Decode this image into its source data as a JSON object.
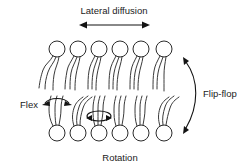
{
  "figure": {
    "title_top": "Lateral diffusion",
    "label_bottom": "Rotation",
    "label_left": "Flex",
    "label_right": "Flip-flop",
    "background_color": "#ffffff",
    "stroke_color": "#2b2b2b",
    "text_color": "#1b1b1b"
  },
  "membrane": {
    "leaflets": [
      {
        "name": "upper-leaflet",
        "orientation": "heads-up",
        "lipid_count": 6,
        "head_radius": 8,
        "head_center_y": 49,
        "tail_length": 40,
        "first_head_center_x": 57,
        "spacing_x": 21
      },
      {
        "name": "lower-leaflet",
        "orientation": "heads-down",
        "lipid_count": 6,
        "head_radius": 8,
        "head_center_y": 133,
        "tail_length": 40,
        "first_head_center_x": 57,
        "spacing_x": 21
      }
    ],
    "total_lipids": 12
  },
  "annotations": [
    {
      "name": "lateral-diffusion",
      "label": "Lateral diffusion",
      "arrow_type": "double-headed-straight",
      "orientation": "horizontal",
      "text_x": 126,
      "text_y": 12,
      "arrow_x1": 81,
      "arrow_x2": 148,
      "arrow_y": 25
    },
    {
      "name": "flex",
      "label": "Flex",
      "arrow_type": "double-headed-curved",
      "orientation": "horizontal-arc",
      "text_x": 29,
      "text_y": 108,
      "pointer_from_x": 42,
      "pointer_to_x": 50
    },
    {
      "name": "rotation",
      "label": "Rotation",
      "arrow_type": "ellipse-double-headed",
      "orientation": "axial",
      "text_x": 120,
      "text_y": 159,
      "ellipse_cx": 100,
      "ellipse_cy": 117,
      "ellipse_rx": 12,
      "ellipse_ry": 5
    },
    {
      "name": "flip-flop",
      "label": "Flip-flop",
      "arrow_type": "double-headed-curved",
      "orientation": "vertical-arc",
      "text_x": 224,
      "text_y": 96,
      "arc_top_x": 192,
      "arc_top_y": 58,
      "arc_bottom_x": 192,
      "arc_bottom_y": 132
    }
  ]
}
